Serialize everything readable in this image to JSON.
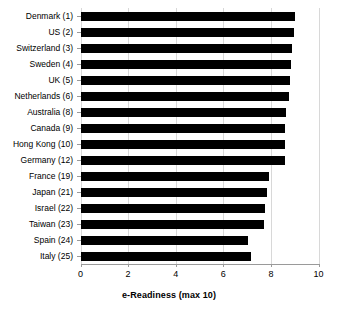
{
  "chart_data": {
    "type": "bar",
    "orientation": "horizontal",
    "title": "",
    "xlabel": "e-Readiness (max 10)",
    "ylabel": "",
    "xlim": [
      0,
      10
    ],
    "xticks": [
      0,
      2,
      4,
      6,
      8,
      10
    ],
    "xtick_labels": [
      "0",
      "2",
      "4",
      "6",
      "8",
      "10"
    ],
    "grid": "vertical light gridlines at x ticks",
    "legend": "none",
    "bar_color": "#000000",
    "categories": [
      "Denmark (1)",
      "US (2)",
      "Switzerland (3)",
      "Sweden (4)",
      "UK (5)",
      "Netherlands (6)",
      "Australia (8)",
      "Canada (9)",
      "Hong Kong (10)",
      "Germany (12)",
      "France (19)",
      "Japan (21)",
      "Israel (22)",
      "Taiwan (23)",
      "Spain (24)",
      "Italy (25)"
    ],
    "values": [
      9.0,
      8.95,
      8.9,
      8.85,
      8.8,
      8.75,
      8.65,
      8.6,
      8.6,
      8.6,
      7.9,
      7.85,
      7.75,
      7.7,
      7.05,
      7.15
    ]
  }
}
